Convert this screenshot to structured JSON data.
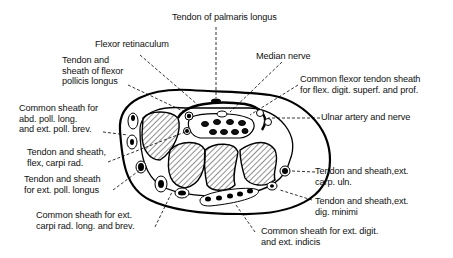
{
  "diagram": {
    "labels": {
      "palmaris_longus": "Tendon of palmaris longus",
      "flexor_retinaculum": "Flexor retinaculum",
      "median_nerve": "Median nerve",
      "fpl": "Tendon and\nsheath of flexor\npollicis longus",
      "common_flexor": "Common flexor tendon sheath\nfor flex. digit. superf. and prof.",
      "abd_poll": "Common sheath for\nabd. poll. long.\nand ext. poll. brev.",
      "ulnar": "Ulnar artery and nerve",
      "fcr": "Tendon and sheath,\nflex, carpi rad.",
      "epl": "Tendon and sheath\nfor ext. poll. longus",
      "ecu": "Tendon and sheath,ext.\ncarp. uln.",
      "edm": "Tendon and sheath,ext.\ndig. minimi",
      "ecrl": "Common sheath for ext.\ncarpi rad. long. and brev.",
      "ed": "Common sheath for ext. digit.\nand ext. indicis"
    }
  }
}
